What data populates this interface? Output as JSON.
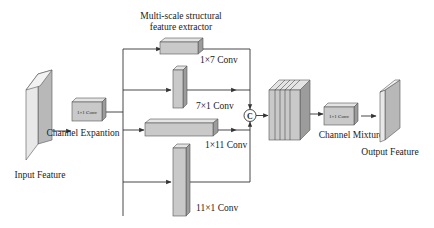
{
  "diagram": {
    "title": "Multi-scale structural feature extractor",
    "title_line1": "Multi-scale structural",
    "title_line2": "feature extractor",
    "nodes": {
      "input_feature": {
        "label": "Input Feature"
      },
      "channel_expansion": {
        "label": "Channel Expantion",
        "box_text": "1×1 Conv"
      },
      "branch_1x7": {
        "label": "1×7 Conv"
      },
      "branch_7x1": {
        "label": "7×1 Conv"
      },
      "branch_1x11": {
        "label": "1×11 Conv"
      },
      "branch_11x1": {
        "label": "11×1 Conv"
      },
      "concat": {
        "symbol": "C"
      },
      "channel_mixture": {
        "label": "Channel Mixture",
        "box_text": "1×1 Conv"
      },
      "output_feature": {
        "label": "Output Feature"
      }
    },
    "edges": [
      [
        "input_feature",
        "channel_expansion"
      ],
      [
        "channel_expansion",
        "branch_1x7"
      ],
      [
        "channel_expansion",
        "branch_7x1"
      ],
      [
        "channel_expansion",
        "branch_1x11"
      ],
      [
        "channel_expansion",
        "branch_11x1"
      ],
      [
        "branch_1x7",
        "concat"
      ],
      [
        "branch_7x1",
        "concat"
      ],
      [
        "branch_1x11",
        "concat"
      ],
      [
        "branch_11x1",
        "concat"
      ],
      [
        "concat",
        "stacked_features"
      ],
      [
        "stacked_features",
        "channel_mixture"
      ],
      [
        "channel_mixture",
        "output_feature"
      ]
    ],
    "colors": {
      "block_front": "#c9c9c9",
      "block_top": "#e4e4e4",
      "block_side": "#9c9c9c",
      "line": "#333333"
    }
  }
}
